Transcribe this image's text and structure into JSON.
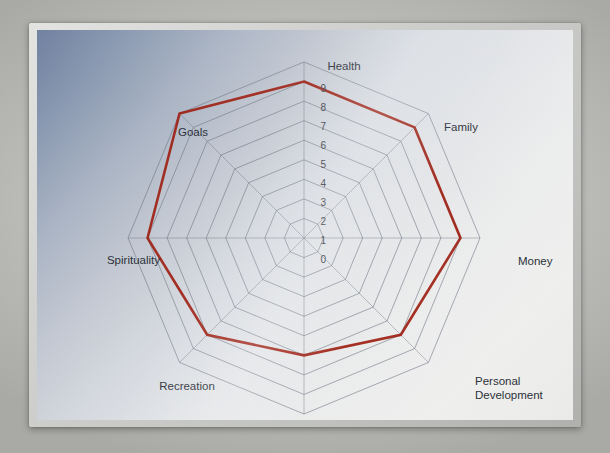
{
  "page": {
    "media": "photograph of a printed chart on a laminated card",
    "frame_color": "#c8c8c6",
    "background_gradient_from": "#6d7f9e",
    "background_gradient_to": "#f0f0ef"
  },
  "chart_data": {
    "type": "radar",
    "title": "",
    "subtitle": "",
    "xlabel": "",
    "ylabel": "",
    "categories": [
      "Health",
      "Family",
      "Money",
      "Personal Development",
      "Career",
      "Recreation",
      "Spirituality",
      "Goals"
    ],
    "values": [
      8,
      8,
      8,
      7,
      6,
      7,
      8,
      9
    ],
    "series": [
      {
        "name": "Current score",
        "color": "#9e1f12",
        "values": [
          8,
          8,
          8,
          7,
          6,
          7,
          8,
          9
        ]
      }
    ],
    "rlim": [
      0,
      9
    ],
    "r_ticks": [
      0,
      1,
      2,
      3,
      4,
      5,
      6,
      7,
      8,
      9
    ],
    "r_tick_labels": [
      "0",
      "1",
      "2",
      "3",
      "4",
      "5",
      "6",
      "7",
      "8",
      "9"
    ],
    "tick_axis": "Health",
    "grid": true,
    "grid_shape": "polygon",
    "grid_color": "#6a7180",
    "legend": false,
    "legend_position": "none",
    "start_angle_deg": 90,
    "direction": "clockwise",
    "annotations": []
  },
  "axis_labels": [
    {
      "text": "Health",
      "line2": "",
      "x": 307,
      "y": 40,
      "anchor": "middle"
    },
    {
      "text": "Family",
      "line2": "",
      "x": 424,
      "y": 101,
      "anchor": "middle"
    },
    {
      "text": "Money",
      "line2": "",
      "x": 481,
      "y": 235,
      "anchor": "start"
    },
    {
      "text": "Personal",
      "line2": "Development",
      "x": 438,
      "y": 355,
      "anchor": "start"
    },
    {
      "text": "Career",
      "line2": "",
      "x": 296,
      "y": 414,
      "anchor": "middle"
    },
    {
      "text": "Recreation",
      "line2": "",
      "x": 150,
      "y": 360,
      "anchor": "middle"
    },
    {
      "text": "Spirituality",
      "line2": "",
      "x": 123,
      "y": 234,
      "anchor": "end"
    },
    {
      "text": "Goals",
      "line2": "",
      "x": 156,
      "y": 106,
      "anchor": "middle"
    }
  ],
  "tick_labels": [
    {
      "value": "9",
      "x": 289,
      "y": 62
    },
    {
      "value": "8",
      "x": 289,
      "y": 81
    },
    {
      "value": "7",
      "x": 289,
      "y": 100
    },
    {
      "value": "6",
      "x": 289,
      "y": 119
    },
    {
      "value": "5",
      "x": 289,
      "y": 138
    },
    {
      "value": "4",
      "x": 289,
      "y": 157
    },
    {
      "value": "3",
      "x": 289,
      "y": 176
    },
    {
      "value": "2",
      "x": 289,
      "y": 195
    },
    {
      "value": "1",
      "x": 289,
      "y": 214
    },
    {
      "value": "0",
      "x": 289,
      "y": 233
    }
  ]
}
